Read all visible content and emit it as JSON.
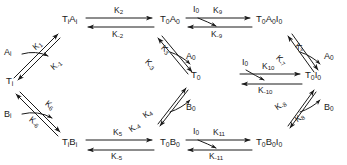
{
  "diagram": {
    "ink_color": "#1a1a1a",
    "background": "#ffffff",
    "nodes": [
      {
        "id": "TiAi",
        "label": "TᵢAᵢ",
        "x": 62,
        "y": 22
      },
      {
        "id": "T0A0",
        "label": "T₀A₀",
        "x": 160,
        "y": 22
      },
      {
        "id": "T0A0I0",
        "label": "T₀A₀I₀",
        "x": 258,
        "y": 22
      },
      {
        "id": "Ti",
        "label": "Tᵢ",
        "x": 10,
        "y": 83
      },
      {
        "id": "T0",
        "label": "T₀",
        "x": 180,
        "y": 78
      },
      {
        "id": "T0I0",
        "label": "T₀I₀",
        "x": 307,
        "y": 78
      },
      {
        "id": "TiBi",
        "label": "TᵢBᵢ",
        "x": 62,
        "y": 144
      },
      {
        "id": "T0B0",
        "label": "T₀B₀",
        "x": 160,
        "y": 144
      },
      {
        "id": "T0B0I0",
        "label": "T₀B₀I₀",
        "x": 258,
        "y": 144
      }
    ],
    "rate_constants": [
      {
        "id": "K1",
        "label": "K₁",
        "x": 45,
        "y": 40
      },
      {
        "id": "Km1",
        "label": "K₋₁",
        "x": 62,
        "y": 60
      },
      {
        "id": "K2",
        "label": "K₂",
        "x": 120,
        "y": 10
      },
      {
        "id": "Km2",
        "label": "K₋₂",
        "x": 120,
        "y": 40
      },
      {
        "id": "K3",
        "label": "K₃",
        "x": 152,
        "y": 45
      },
      {
        "id": "Km3",
        "label": "K₋₃",
        "x": 132,
        "y": 58
      },
      {
        "id": "K4",
        "label": "K₄",
        "x": 132,
        "y": 108
      },
      {
        "id": "Km4",
        "label": "K₋₄",
        "x": 152,
        "y": 122
      },
      {
        "id": "K5",
        "label": "K₅",
        "x": 118,
        "y": 132
      },
      {
        "id": "Km5",
        "label": "K₋₅",
        "x": 118,
        "y": 158
      },
      {
        "id": "K6",
        "label": "K₆",
        "x": 60,
        "y": 95
      },
      {
        "id": "Km6",
        "label": "K₋₆",
        "x": 38,
        "y": 115
      },
      {
        "id": "K7",
        "label": "K₇",
        "x": 300,
        "y": 40
      },
      {
        "id": "Km7",
        "label": "K₋₇",
        "x": 278,
        "y": 52
      },
      {
        "id": "K8",
        "label": "K₈",
        "x": 300,
        "y": 122
      },
      {
        "id": "Km8",
        "label": "K₋₈",
        "x": 278,
        "y": 108
      },
      {
        "id": "K9",
        "label": "K₉",
        "x": 218,
        "y": 10
      },
      {
        "id": "Km9",
        "label": "K₋₉",
        "x": 218,
        "y": 40
      },
      {
        "id": "K10",
        "label": "K₁₀",
        "x": 272,
        "y": 66
      },
      {
        "id": "Km10",
        "label": "K₋₁₀",
        "x": 268,
        "y": 93
      },
      {
        "id": "K11",
        "label": "K₁₁",
        "x": 218,
        "y": 132
      },
      {
        "id": "Km11",
        "label": "K₋₁₁",
        "x": 214,
        "y": 158
      }
    ],
    "species_labels": [
      {
        "id": "Ai_left",
        "label": "Aᵢ",
        "x": 6,
        "y": 52
      },
      {
        "id": "Bi_left",
        "label": "Bᵢ",
        "x": 6,
        "y": 115
      },
      {
        "id": "A0_mid",
        "label": "A₀",
        "x": 186,
        "y": 56
      },
      {
        "id": "B0_mid",
        "label": "B₀",
        "x": 186,
        "y": 107
      },
      {
        "id": "I0_top",
        "label": "I₀",
        "x": 196,
        "y": 10
      },
      {
        "id": "I0_bot",
        "label": "I₀",
        "x": 196,
        "y": 132
      },
      {
        "id": "A0_right",
        "label": "A₀",
        "x": 325,
        "y": 56
      },
      {
        "id": "B0_right",
        "label": "B₀",
        "x": 325,
        "y": 107
      },
      {
        "id": "I0_mid",
        "label": "I₀",
        "x": 244,
        "y": 62
      }
    ]
  }
}
